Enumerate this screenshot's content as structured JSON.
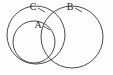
{
  "figure": {
    "type": "venn-diagram",
    "width": 113,
    "height": 75,
    "background_color": "#fdfdfd",
    "stroke_color": "#4a4a4a",
    "label_color": "#2b2b2b"
  },
  "chart_data": {
    "type": "diagram",
    "title": "",
    "sets": [
      {
        "label": "A",
        "name": "set-a",
        "cx": 34,
        "cy": 42,
        "r": 21,
        "label_x": 38,
        "label_y": 26
      },
      {
        "label": "C",
        "name": "set-c",
        "cx": 36,
        "cy": 35,
        "r": 29,
        "label_x": 33,
        "label_y": 8
      },
      {
        "label": "B",
        "name": "set-b",
        "cx": 72,
        "cy": 37,
        "r": 31,
        "label_x": 70,
        "label_y": 8
      }
    ],
    "relations": [
      "A is contained within C",
      "C overlaps B",
      "A overlaps B"
    ]
  },
  "labels": {
    "a": "A",
    "b": "B",
    "c": "C"
  }
}
